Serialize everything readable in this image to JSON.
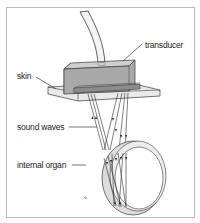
{
  "figure": {
    "labels": {
      "transducer": "transducer",
      "skin": "skin",
      "sound_waves": "sound waves",
      "internal_organ": "internal organ"
    },
    "colors": {
      "border": "#b9b9b9",
      "stroke": "#3a3a3a",
      "transducer_face": "#a9a9a9",
      "transducer_top": "#c8c8c8",
      "transducer_side": "#8e8e8e",
      "skin_fill": "#e6e6e6",
      "organ_fill": "#dcdcdc",
      "cable_fill": "#f4f4f4"
    }
  }
}
